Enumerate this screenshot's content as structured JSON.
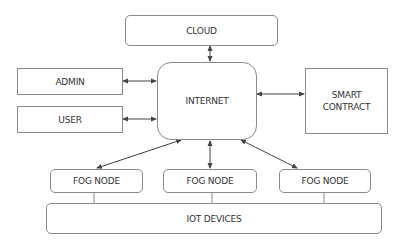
{
  "diagram": {
    "nodes": {
      "cloud": {
        "label": "CLOUD"
      },
      "internet": {
        "label": "INTERNET"
      },
      "admin": {
        "label": "ADMIN"
      },
      "user": {
        "label": "USER"
      },
      "smart_contract": {
        "label": "SMART CONTRACT"
      },
      "fog_node_1": {
        "label": "FOG NODE"
      },
      "fog_node_2": {
        "label": "FOG NODE"
      },
      "fog_node_3": {
        "label": "FOG NODE"
      },
      "iot_devices": {
        "label": "IOT DEVICES"
      }
    },
    "edges": [
      {
        "from": "cloud",
        "to": "internet",
        "type": "bidirectional-arrow"
      },
      {
        "from": "admin",
        "to": "internet",
        "type": "bidirectional-arrow"
      },
      {
        "from": "user",
        "to": "internet",
        "type": "bidirectional-arrow"
      },
      {
        "from": "internet",
        "to": "smart_contract",
        "type": "bidirectional-arrow"
      },
      {
        "from": "internet",
        "to": "fog_node_1",
        "type": "bidirectional-arrow"
      },
      {
        "from": "internet",
        "to": "fog_node_2",
        "type": "bidirectional-arrow"
      },
      {
        "from": "internet",
        "to": "fog_node_3",
        "type": "bidirectional-arrow"
      },
      {
        "from": "fog_node_1",
        "to": "iot_devices",
        "type": "line"
      },
      {
        "from": "fog_node_2",
        "to": "iot_devices",
        "type": "line"
      },
      {
        "from": "fog_node_3",
        "to": "iot_devices",
        "type": "line"
      }
    ],
    "colors": {
      "stroke": "#8a8a8a",
      "arrow": "#444444",
      "text": "#333333"
    }
  }
}
